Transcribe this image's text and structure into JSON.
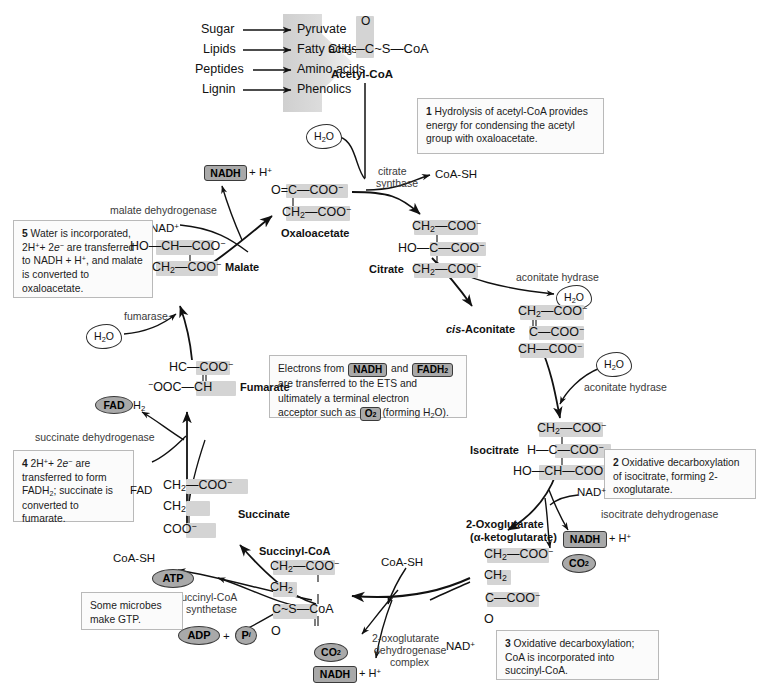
{
  "figure": {
    "colors": {
      "pill_fill": "#a9a9a9",
      "highlight": "#d4d4d4",
      "box_border": "#b9b9b9",
      "funnel_grey": "#d9d9d9",
      "ink": "#111111"
    }
  },
  "inputs": {
    "pairs": [
      {
        "from": "Sugar",
        "to": "Pyruvate"
      },
      {
        "from": "Lipids",
        "to": "Fatty acids"
      },
      {
        "from": "Peptides",
        "to": "Amino acids"
      },
      {
        "from": "Lignin",
        "to": "Phenolics"
      }
    ]
  },
  "metabolites": {
    "acetyl_coa": {
      "name": "Acetyl-CoA",
      "formula_top": "O",
      "formula_main": "CH3—C~S—CoA"
    },
    "oxaloacetate": {
      "name": "Oxaloacetate",
      "line1": "O=C—COO−",
      "line2": "CH2—COO−"
    },
    "citrate": {
      "name": "Citrate",
      "line1": "CH2—COO−",
      "line2": "HO—C—COO−",
      "line3": "CH2—COO−"
    },
    "cis_aconitate": {
      "name": "cis-Aconitate",
      "name_italic_part": "cis",
      "line1": "CH2—COO−",
      "line2": "C—COO−",
      "line3": "CH—COO−"
    },
    "isocitrate": {
      "name": "Isocitrate",
      "line1": "CH2—COO−",
      "line2": "H—C—COO−",
      "line3": "HO—CH—COO−"
    },
    "oxoglutarate": {
      "name": "2-Oxoglutarate",
      "synonym": "(α-ketoglutarate)",
      "line1": "CH2—COO−",
      "line2": "CH2",
      "line3": "C—COO−",
      "line4": "O"
    },
    "succinyl_coa": {
      "name": "Succinyl-CoA",
      "line1": "CH2—COO−",
      "line2": "CH2",
      "line3": "C~S—CoA",
      "line4": "O"
    },
    "succinate": {
      "name": "Succinate",
      "line1": "CH2—COO−",
      "line2": "CH2",
      "line3": "COO−"
    },
    "fumarate": {
      "name": "Fumarate",
      "line1": "HC—COO−",
      "line2": "−OOC—CH"
    },
    "malate": {
      "name": "Malate",
      "line1": "HO—CH—COO−",
      "line2": "CH2—COO−"
    }
  },
  "enzymes": {
    "citrate_synthase": "citrate\nsynthase",
    "citrate_synthase_l1": "citrate",
    "citrate_synthase_l2": "synthase",
    "aconitate_hydrase_1": "aconitate hydrase",
    "aconitate_hydrase_2": "aconitate hydrase",
    "isocitrate_dehydrogenase": "isocitrate dehydrogenase",
    "oxoglutarate_complex_l1": "2-oxoglutarate",
    "oxoglutarate_complex_l2": "dehydrogenase",
    "oxoglutarate_complex_l3": "complex",
    "succinyl_coa_synthetase_l1": "succinyl-CoA",
    "succinyl_coa_synthetase_l2": "synthetase",
    "succinate_dehydrogenase": "succinate dehydrogenase",
    "fumarase": "fumarase",
    "malate_dehydrogenase": "malate dehydrogenase"
  },
  "cofactors": {
    "nadh_malate": "NADH",
    "nadh_malate_suffix": "+ H+",
    "nad_malate": "NAD+",
    "coa_sh_citrate": "CoA-SH",
    "coa_sh_succinate": "CoA-SH",
    "coa_sh_oxoglutarate": "CoA-SH",
    "water_citrate": "H2O",
    "water_aconitate_1": "H2O",
    "water_aconitate_2": "H2O",
    "water_fumarase": "H2O",
    "nad_isocitrate": "NAD+",
    "nadh_isocitrate": "NADH",
    "nadh_isocitrate_suffix": "+ H+",
    "co2_isocitrate": "CO2",
    "nad_oxoglutarate": "NAD+",
    "nadh_oxoglutarate": "NADH",
    "nadh_oxoglutarate_suffix": "+ H+",
    "co2_oxoglutarate": "CO2",
    "atp": "ATP",
    "adp": "ADP",
    "adp_plus": "+",
    "pi": "Pi",
    "fad": "FAD",
    "fadh2": "FAD",
    "fadh2_suffix": "H2"
  },
  "steps": [
    {
      "id": "step-1",
      "number": "1",
      "text": "Hydrolysis of acetyl-CoA provides energy for condensing the acetyl group with oxaloacetate."
    },
    {
      "id": "step-2",
      "number": "2",
      "text": "Oxidative decarboxylation of isocitrate, forming 2-oxoglutarate."
    },
    {
      "id": "step-3",
      "number": "3",
      "text": "Oxidative decarboxylation; CoA is incorporated into succinyl-CoA."
    },
    {
      "id": "step-4",
      "number": "4",
      "text_parts": [
        "2H+ + 2e− are transferred to form FADH2; succinate is converted to fumarate."
      ]
    },
    {
      "id": "step-5",
      "number": "5",
      "text_parts": [
        "Water is incorporated, 2H+ + 2e− are transferred to NADH + H+, and malate is converted to oxaloacetate."
      ]
    }
  ],
  "ets_note": {
    "line1_a": "Electrons from ",
    "line1_pill1": "NADH",
    "line1_b": " and ",
    "line1_pill2": "FADH",
    "line1_pill2_sub": "2",
    "line2": "are transferred to the ETS and",
    "line3": "ultimately a terminal electron",
    "line4_a": "acceptor such as ",
    "line4_pill": "O2",
    "line4_b": " (forming H2O)."
  },
  "gtp_note": {
    "line1": "Some microbes",
    "line2": "make GTP."
  }
}
